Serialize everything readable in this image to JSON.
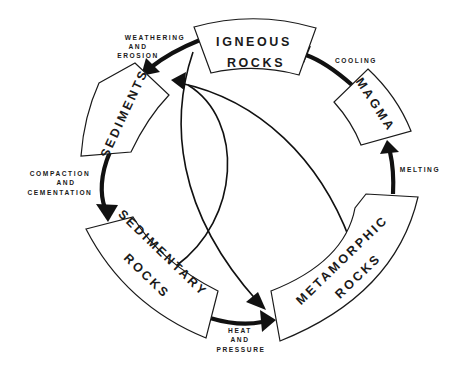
{
  "colors": {
    "ink": "#111111",
    "background": "#ffffff"
  },
  "boxes": {
    "igneous": {
      "line1": "IGNEOUS",
      "line2": "ROCKS"
    },
    "magma": {
      "line1": "MAGMA"
    },
    "metamorphic": {
      "line1": "METAMORPHIC",
      "line2": "ROCKS"
    },
    "sedimentary": {
      "line1": "SEDIMENTARY",
      "line2": "ROCKS"
    },
    "sediments": {
      "line1": "SEDIMENTS"
    }
  },
  "processes": {
    "weathering": {
      "line1": "WEATHERING",
      "line2": "AND",
      "line3": "EROSION"
    },
    "cooling": {
      "line1": "COOLING"
    },
    "melting": {
      "line1": "MELTING"
    },
    "heat_pressure": {
      "line1": "HEAT",
      "line2": "AND",
      "line3": "PRESSURE"
    },
    "compaction": {
      "line1": "COMPACTION",
      "line2": "AND",
      "line3": "CEMENTATION"
    }
  },
  "arrows": [
    {
      "from": "Igneous Rocks",
      "to": "Sediments",
      "label": "Weathering and Erosion",
      "style": "thick"
    },
    {
      "from": "Sediments",
      "to": "Sedimentary Rocks",
      "label": "Compaction and Cementation",
      "style": "thick"
    },
    {
      "from": "Sedimentary Rocks",
      "to": "Metamorphic Rocks",
      "label": "Heat and Pressure",
      "style": "thick"
    },
    {
      "from": "Metamorphic Rocks",
      "to": "Magma",
      "label": "Melting",
      "style": "thick"
    },
    {
      "from": "Magma",
      "to": "Igneous Rocks",
      "label": "Cooling",
      "style": "thick"
    },
    {
      "from": "Igneous Rocks",
      "to": "Metamorphic Rocks",
      "label": "",
      "style": "thin"
    },
    {
      "from": "Sedimentary Rocks",
      "to": "Sediments",
      "label": "",
      "style": "thin"
    },
    {
      "from": "Metamorphic Rocks",
      "to": "Sediments",
      "label": "",
      "style": "thin"
    }
  ]
}
